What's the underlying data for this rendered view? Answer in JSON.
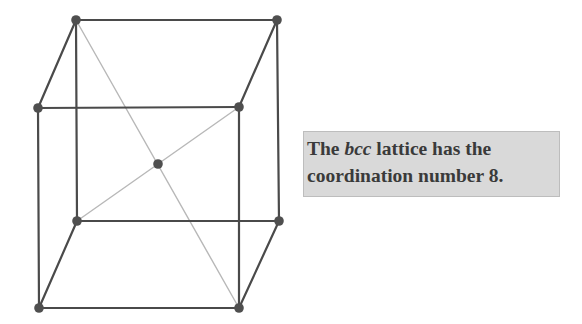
{
  "diagram": {
    "colors": {
      "edge": "#4a4a4a",
      "diagonal": "#b8b8b8",
      "atom": "#4f4f4f",
      "caption_bg": "#d9d9d9",
      "caption_text": "#3a3a3a"
    },
    "atoms": [
      {
        "id": "back-top-left",
        "x": 76,
        "y": 20
      },
      {
        "id": "back-top-right",
        "x": 277,
        "y": 20
      },
      {
        "id": "front-top-left",
        "x": 38,
        "y": 108
      },
      {
        "id": "front-top-right",
        "x": 239,
        "y": 107
      },
      {
        "id": "body-center",
        "x": 158,
        "y": 164
      },
      {
        "id": "back-bottom-left",
        "x": 77,
        "y": 221
      },
      {
        "id": "back-bottom-right",
        "x": 279,
        "y": 221
      },
      {
        "id": "front-bottom-left",
        "x": 39,
        "y": 308
      },
      {
        "id": "front-bottom-right",
        "x": 239,
        "y": 308
      }
    ],
    "edges": [
      [
        "back-top-left",
        "back-top-right"
      ],
      [
        "back-top-left",
        "front-top-left"
      ],
      [
        "back-top-right",
        "front-top-right"
      ],
      [
        "front-top-left",
        "front-top-right"
      ],
      [
        "back-top-left",
        "back-bottom-left"
      ],
      [
        "back-top-right",
        "back-bottom-right"
      ],
      [
        "front-top-left",
        "front-bottom-left"
      ],
      [
        "front-top-right",
        "front-bottom-right"
      ],
      [
        "back-bottom-left",
        "back-bottom-right"
      ],
      [
        "back-bottom-left",
        "front-bottom-left"
      ],
      [
        "back-bottom-right",
        "front-bottom-right"
      ],
      [
        "front-bottom-left",
        "front-bottom-right"
      ]
    ],
    "diagonals": [
      [
        "back-top-left",
        "front-bottom-right"
      ],
      [
        "front-top-right",
        "back-bottom-left"
      ]
    ]
  },
  "caption": {
    "line1_prefix": "The ",
    "line1_italic": "bcc",
    "line1_suffix": " lattice has the",
    "line2": "coordination number 8."
  }
}
